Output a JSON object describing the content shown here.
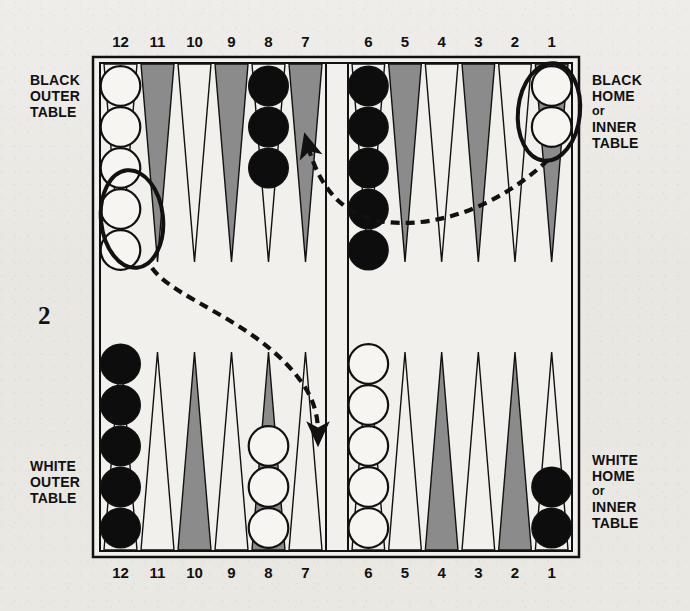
{
  "figure": {
    "number": "2",
    "caption_labels": {
      "black_outer": [
        "BLACK",
        "OUTER",
        "TABLE"
      ],
      "white_outer": [
        "WHITE",
        "OUTER",
        "TABLE"
      ],
      "black_home": [
        "BLACK",
        "HOME",
        "or",
        "INNER",
        "TABLE"
      ],
      "white_home": [
        "WHITE",
        "HOME",
        "or",
        "INNER",
        "TABLE"
      ]
    }
  },
  "board": {
    "geometry": {
      "outer_x": 93,
      "outer_y": 57,
      "outer_w": 486,
      "outer_h": 500,
      "inner_x": 100,
      "inner_y": 63,
      "inner_w": 472,
      "inner_h": 488,
      "bar_x": 326,
      "bar_w": 22,
      "left_quad_x": 102,
      "left_quad_w": 222,
      "right_quad_x": 350,
      "right_quad_w": 220,
      "point_width": 37,
      "point_height": 198,
      "checker_diameter": 42
    },
    "colors": {
      "board_fill": "#f2f0ec",
      "line": "#111111",
      "point_dark": "#8b8b8b",
      "point_light": "#f2f0ec",
      "checker_black": "#0d0d0d",
      "checker_white": "#f6f5f1",
      "highlight_ring": "#111111",
      "arrow": "#111111"
    },
    "top_numbers": [
      "12",
      "11",
      "10",
      "9",
      "8",
      "7",
      "6",
      "5",
      "4",
      "3",
      "2",
      "1"
    ],
    "bottom_numbers": [
      "12",
      "11",
      "10",
      "9",
      "8",
      "7",
      "6",
      "5",
      "4",
      "3",
      "2",
      "1"
    ],
    "top_points": [
      {
        "label": "12",
        "shade": "light",
        "checkers": 5,
        "color": "white",
        "highlighted": 2
      },
      {
        "label": "11",
        "shade": "dark",
        "checkers": 0,
        "color": null,
        "highlighted": 0
      },
      {
        "label": "10",
        "shade": "light",
        "checkers": 0,
        "color": null,
        "highlighted": 0
      },
      {
        "label": "9",
        "shade": "dark",
        "checkers": 0,
        "color": null,
        "highlighted": 0
      },
      {
        "label": "8",
        "shade": "light",
        "checkers": 3,
        "color": "black",
        "highlighted": 0
      },
      {
        "label": "7",
        "shade": "dark",
        "checkers": 0,
        "color": null,
        "highlighted": 0
      },
      {
        "label": "6",
        "shade": "light",
        "checkers": 5,
        "color": "black",
        "highlighted": 0
      },
      {
        "label": "5",
        "shade": "dark",
        "checkers": 0,
        "color": null,
        "highlighted": 0
      },
      {
        "label": "4",
        "shade": "light",
        "checkers": 0,
        "color": null,
        "highlighted": 0
      },
      {
        "label": "3",
        "shade": "dark",
        "checkers": 0,
        "color": null,
        "highlighted": 0
      },
      {
        "label": "2",
        "shade": "light",
        "checkers": 0,
        "color": null,
        "highlighted": 0
      },
      {
        "label": "1",
        "shade": "dark",
        "checkers": 2,
        "color": "white",
        "highlighted": 2
      }
    ],
    "bottom_points": [
      {
        "label": "12",
        "shade": "light",
        "checkers": 5,
        "color": "black",
        "highlighted": 0
      },
      {
        "label": "11",
        "shade": "light",
        "checkers": 0,
        "color": null,
        "highlighted": 0
      },
      {
        "label": "10",
        "shade": "dark",
        "checkers": 0,
        "color": null,
        "highlighted": 0
      },
      {
        "label": "9",
        "shade": "light",
        "checkers": 0,
        "color": null,
        "highlighted": 0
      },
      {
        "label": "8",
        "shade": "dark",
        "checkers": 3,
        "color": "white",
        "highlighted": 0
      },
      {
        "label": "7",
        "shade": "light",
        "checkers": 0,
        "color": null,
        "highlighted": 0
      },
      {
        "label": "6",
        "shade": "light",
        "checkers": 5,
        "color": "white",
        "highlighted": 0
      },
      {
        "label": "5",
        "shade": "light",
        "checkers": 0,
        "color": null,
        "highlighted": 0
      },
      {
        "label": "4",
        "shade": "dark",
        "checkers": 0,
        "color": null,
        "highlighted": 0
      },
      {
        "label": "3",
        "shade": "light",
        "checkers": 0,
        "color": null,
        "highlighted": 0
      },
      {
        "label": "2",
        "shade": "dark",
        "checkers": 0,
        "color": null,
        "highlighted": 0
      },
      {
        "label": "1",
        "shade": "light",
        "checkers": 2,
        "color": "black",
        "highlighted": 0
      }
    ],
    "move_arrows": [
      {
        "name": "white-12-to-bottom-7",
        "from_point": "12 top",
        "to_point": "7 bottom",
        "style": "dashed",
        "path": "M 152 268 C 175 300, 255 320, 300 380 C 316 401, 318 420, 318 433"
      },
      {
        "name": "white-1-to-top-7",
        "from_point": "1 top",
        "to_point": "7 top",
        "style": "dashed",
        "path": "M 548 160 C 500 205, 440 228, 386 222 C 345 217, 320 190, 308 146"
      }
    ],
    "highlight_rings": [
      {
        "name": "ring-top-12-white-pair",
        "cx": 132,
        "cy": 219,
        "rx": 31,
        "ry": 49,
        "rotate": -6
      },
      {
        "name": "ring-top-1-white-pair",
        "cx": 549,
        "cy": 112,
        "rx": 31,
        "ry": 49,
        "rotate": 6
      }
    ]
  }
}
